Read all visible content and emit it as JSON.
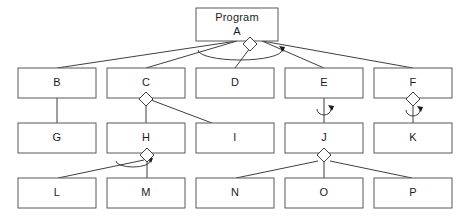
{
  "diagram": {
    "kind": "structure-chart",
    "title_node": {
      "id": "A",
      "line1": "Program",
      "line2": "A"
    },
    "colors": {
      "background": "#ffffff",
      "box_stroke": "#58585a",
      "line_stroke": "#3f3f41",
      "text": "#1b1b1b"
    },
    "nodes": [
      {
        "id": "A",
        "label": "A",
        "title": "Program",
        "x": 196,
        "y": 8,
        "w": 82,
        "h": 33,
        "row": 1
      },
      {
        "id": "B",
        "label": "B",
        "title": "",
        "x": 18,
        "y": 68,
        "w": 78,
        "h": 30,
        "row": 2
      },
      {
        "id": "C",
        "label": "C",
        "title": "",
        "x": 107,
        "y": 68,
        "w": 78,
        "h": 30,
        "row": 2
      },
      {
        "id": "D",
        "label": "D",
        "title": "",
        "x": 196,
        "y": 68,
        "w": 78,
        "h": 30,
        "row": 2
      },
      {
        "id": "E",
        "label": "E",
        "title": "",
        "x": 285,
        "y": 68,
        "w": 78,
        "h": 30,
        "row": 2
      },
      {
        "id": "F",
        "label": "F",
        "title": "",
        "x": 374,
        "y": 68,
        "w": 78,
        "h": 30,
        "row": 2
      },
      {
        "id": "G",
        "label": "G",
        "title": "",
        "x": 18,
        "y": 123,
        "w": 78,
        "h": 30,
        "row": 3
      },
      {
        "id": "H",
        "label": "H",
        "title": "",
        "x": 107,
        "y": 123,
        "w": 78,
        "h": 30,
        "row": 3
      },
      {
        "id": "I",
        "label": "I",
        "title": "",
        "x": 196,
        "y": 123,
        "w": 78,
        "h": 30,
        "row": 3
      },
      {
        "id": "J",
        "label": "J",
        "title": "",
        "x": 285,
        "y": 123,
        "w": 78,
        "h": 30,
        "row": 3
      },
      {
        "id": "K",
        "label": "K",
        "title": "",
        "x": 374,
        "y": 123,
        "w": 78,
        "h": 30,
        "row": 3
      },
      {
        "id": "L",
        "label": "L",
        "title": "",
        "x": 18,
        "y": 178,
        "w": 78,
        "h": 30,
        "row": 4
      },
      {
        "id": "M",
        "label": "M",
        "title": "",
        "x": 107,
        "y": 178,
        "w": 78,
        "h": 30,
        "row": 4
      },
      {
        "id": "N",
        "label": "N",
        "title": "",
        "x": 196,
        "y": 178,
        "w": 78,
        "h": 30,
        "row": 4
      },
      {
        "id": "O",
        "label": "O",
        "title": "",
        "x": 285,
        "y": 178,
        "w": 78,
        "h": 30,
        "row": 4
      },
      {
        "id": "P",
        "label": "P",
        "title": "",
        "x": 374,
        "y": 178,
        "w": 78,
        "h": 30,
        "row": 4
      }
    ],
    "connectors": [
      {
        "from": "A",
        "to": "B",
        "x1": 237,
        "y1": 41,
        "x2": 57,
        "y2": 68
      },
      {
        "from": "A",
        "to": "C",
        "x1": 237,
        "y1": 41,
        "x2": 146,
        "y2": 68
      },
      {
        "from": "A",
        "to": "D",
        "x1": 250,
        "y1": 48,
        "x2": 235,
        "y2": 68
      },
      {
        "from": "A",
        "to": "E",
        "x1": 262,
        "y1": 41,
        "x2": 324,
        "y2": 68
      },
      {
        "from": "A",
        "to": "F",
        "x1": 262,
        "y1": 41,
        "x2": 413,
        "y2": 68
      },
      {
        "from": "B",
        "to": "G",
        "x1": 57,
        "y1": 98,
        "x2": 57,
        "y2": 123
      },
      {
        "from": "C",
        "to": "H",
        "x1": 146,
        "y1": 103,
        "x2": 146,
        "y2": 123
      },
      {
        "from": "C",
        "to": "I",
        "x1": 151,
        "y1": 100,
        "x2": 212,
        "y2": 123
      },
      {
        "from": "E",
        "to": "J",
        "x1": 324,
        "y1": 98,
        "x2": 324,
        "y2": 123
      },
      {
        "from": "F",
        "to": "K",
        "x1": 413,
        "y1": 103,
        "x2": 413,
        "y2": 123
      },
      {
        "from": "H",
        "to": "L",
        "x1": 144,
        "y1": 160,
        "x2": 58,
        "y2": 178
      },
      {
        "from": "H",
        "to": "M",
        "x1": 147,
        "y1": 162,
        "x2": 147,
        "y2": 178
      },
      {
        "from": "J",
        "to": "N",
        "x1": 318,
        "y1": 161,
        "x2": 236,
        "y2": 178
      },
      {
        "from": "J",
        "to": "O",
        "x1": 324,
        "y1": 162,
        "x2": 324,
        "y2": 178
      },
      {
        "from": "J",
        "to": "P",
        "x1": 330,
        "y1": 161,
        "x2": 412,
        "y2": 178
      }
    ],
    "decision_diamonds": [
      {
        "on": "A",
        "cx": 250,
        "cy": 44,
        "r": 7
      },
      {
        "on": "C",
        "cx": 146,
        "cy": 99,
        "r": 7
      },
      {
        "on": "F",
        "cx": 413,
        "cy": 99,
        "r": 7
      },
      {
        "on": "H",
        "cx": 147,
        "cy": 155,
        "r": 7
      },
      {
        "on": "J",
        "cx": 324,
        "cy": 155,
        "r": 7
      }
    ],
    "iteration_loops": [
      {
        "on": "A",
        "cx": 240,
        "cy": 50,
        "rx": 42,
        "ry": 10,
        "side": "wide"
      },
      {
        "on": "E",
        "cx": 324,
        "cy": 109,
        "rx": 7,
        "ry": 6,
        "side": "small"
      },
      {
        "on": "F",
        "cx": 413,
        "cy": 110,
        "rx": 7,
        "ry": 6,
        "side": "small"
      },
      {
        "on": "H",
        "cx": 133,
        "cy": 161,
        "rx": 17,
        "ry": 6,
        "side": "small"
      }
    ],
    "legend_note": ""
  },
  "chart_data": {
    "type": "table",
    "levels": [
      {
        "level": 1,
        "modules": [
          "A"
        ]
      },
      {
        "level": 2,
        "modules": [
          "B",
          "C",
          "D",
          "E",
          "F"
        ]
      },
      {
        "level": 3,
        "modules": [
          "G",
          "H",
          "I",
          "J",
          "K"
        ]
      },
      {
        "level": 4,
        "modules": [
          "L",
          "M",
          "N",
          "O",
          "P"
        ]
      }
    ],
    "edges": [
      [
        "A",
        "B"
      ],
      [
        "A",
        "C"
      ],
      [
        "A",
        "D"
      ],
      [
        "A",
        "E"
      ],
      [
        "A",
        "F"
      ],
      [
        "B",
        "G"
      ],
      [
        "C",
        "H"
      ],
      [
        "C",
        "I"
      ],
      [
        "E",
        "J"
      ],
      [
        "F",
        "K"
      ],
      [
        "H",
        "L"
      ],
      [
        "H",
        "M"
      ],
      [
        "J",
        "N"
      ],
      [
        "J",
        "O"
      ],
      [
        "J",
        "P"
      ]
    ],
    "selection_symbols_on": [
      "A",
      "C",
      "F",
      "H",
      "J"
    ],
    "iteration_symbols_on": [
      "A",
      "E",
      "F",
      "H"
    ]
  }
}
